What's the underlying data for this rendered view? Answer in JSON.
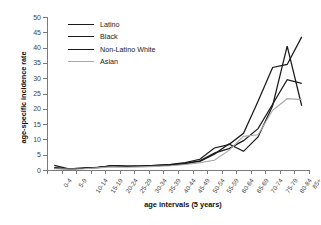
{
  "chart_data": {
    "type": "line",
    "title": "",
    "xlabel": "age intervals (5 years)",
    "ylabel": "age-specific incidence rate",
    "ylim": [
      0,
      50
    ],
    "yticks": [
      0,
      5,
      10,
      15,
      20,
      25,
      30,
      35,
      40,
      45,
      50
    ],
    "grid": false,
    "legend_position": "upper-left-inside",
    "categories": [
      "0-4",
      "5-9",
      "10-14",
      "15-19",
      "20-24",
      "25-29",
      "30-34",
      "35-39",
      "40-44",
      "45-49",
      "50-54",
      "55-59",
      "60-64",
      "65-69",
      "70-74",
      "75-79",
      "80-84",
      "85+"
    ],
    "series": [
      {
        "name": "Latino",
        "color": "#1a1a1a",
        "values": [
          1.5,
          0.4,
          0.5,
          0.8,
          1.4,
          1.2,
          1.3,
          1.4,
          1.6,
          2.0,
          2.8,
          5.2,
          8.5,
          6.1,
          10.8,
          21.0,
          40.5,
          21.0
        ]
      },
      {
        "name": "Black",
        "color": "#1a1a1a",
        "values": [
          0.6,
          0.4,
          0.6,
          0.9,
          1.3,
          1.2,
          1.3,
          1.5,
          1.8,
          2.4,
          3.5,
          7.2,
          8.3,
          12.0,
          22.5,
          33.5,
          34.5,
          43.5
        ]
      },
      {
        "name": "Non-Latino White",
        "color": "#1a1a1a",
        "values": [
          0.8,
          0.4,
          0.6,
          0.9,
          1.4,
          1.3,
          1.3,
          1.5,
          1.7,
          2.2,
          3.0,
          5.5,
          7.0,
          9.6,
          13.5,
          21.5,
          29.5,
          28.3
        ]
      },
      {
        "name": "Asian",
        "color": "#a8a8a8",
        "values": [
          0.4,
          0.3,
          0.4,
          0.7,
          1.0,
          0.9,
          1.0,
          1.2,
          1.4,
          1.8,
          2.4,
          3.2,
          6.4,
          11.0,
          11.5,
          19.5,
          23.3,
          23.0
        ]
      }
    ]
  },
  "legend": {
    "items": [
      {
        "label": "Latino"
      },
      {
        "label": "Black"
      },
      {
        "label": "Non-Latino White"
      },
      {
        "label": "Asian"
      }
    ]
  }
}
